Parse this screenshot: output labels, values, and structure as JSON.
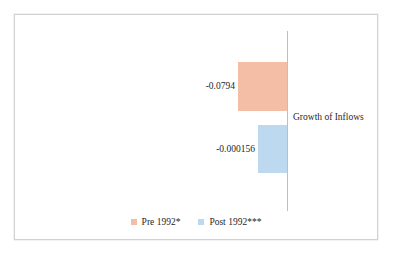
{
  "chart_data": {
    "type": "bar",
    "title": "",
    "subtitle": "",
    "orientation": "horizontal",
    "xlabel": "",
    "ylabel": "",
    "categories": [
      "Growth of Inflows"
    ],
    "category_label": "Growth of Inflows",
    "series": [
      {
        "name": "Pre 1992*",
        "values": [
          -0.0794
        ],
        "value_label": "-0.0794",
        "color": "#f4bda6"
      },
      {
        "name": "Post 1992***",
        "values": [
          -0.000156
        ],
        "value_label": "-0.000156",
        "color": "#bcd9f0"
      }
    ],
    "axis": {
      "zero_line": 0,
      "grid": false,
      "tick_labels": [],
      "show_value_axis": false
    },
    "legend": {
      "position": "bottom",
      "entries": [
        "Pre 1992*",
        "Post 1992***"
      ]
    },
    "annotations": [
      "Growth of Inflows"
    ]
  },
  "chart": {
    "axis_category_label": "Growth of Inflows",
    "bars": {
      "pre": {
        "label": "-0.0794",
        "series_name": "Pre 1992*",
        "color": "#f4bda6"
      },
      "post": {
        "label": "-0.000156",
        "series_name": "Post 1992***",
        "color": "#bcd9f0"
      }
    },
    "legend": {
      "items": [
        {
          "label": "Pre 1992*",
          "color": "#f4bda6"
        },
        {
          "label": "Post 1992***",
          "color": "#bcd9f0"
        }
      ]
    }
  },
  "colors": {
    "pre_1992": "#f4bda6",
    "post_1992": "#bcd9f0",
    "axis_line": "#bfbfbf",
    "frame_border": "#d2d2d2",
    "text": "#262626",
    "background": "#ffffff"
  }
}
